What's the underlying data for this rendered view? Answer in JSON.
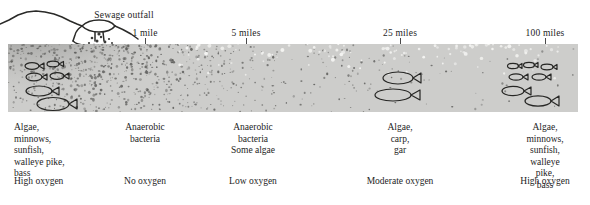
{
  "figure": {
    "title_annotation": "Sewage outfall",
    "water_color": "#cdcdcb",
    "ink_color": "#1d1d1d"
  },
  "axis": {
    "unit": "miles",
    "ticks": [
      {
        "label": "1 mile",
        "x": 145
      },
      {
        "label": "5 miles",
        "x": 246
      },
      {
        "label": "25 miles",
        "x": 400
      },
      {
        "label": "100 miles",
        "x": 545
      }
    ]
  },
  "zones": [
    {
      "id": "zone-clean-upstream",
      "x": 14,
      "align": "left",
      "species": "Algae,\nminnows,\nsunfish,\nwalleye pike,\nbass",
      "oxygen": "High oxygen",
      "oxygen_x": 14,
      "fish_count": 6,
      "turbidity": "clear"
    },
    {
      "id": "zone-septic",
      "x": 145,
      "align": "center",
      "species": "Anaerobic\nbacteria",
      "oxygen": "No oxygen",
      "oxygen_x": 145,
      "fish_count": 0,
      "turbidity": "very-heavy"
    },
    {
      "id": "zone-recovery-early",
      "x": 253,
      "align": "center",
      "species": "Anaerobic\nbacteria\nSome algae",
      "oxygen": "Low oxygen",
      "oxygen_x": 253,
      "fish_count": 0,
      "turbidity": "heavy"
    },
    {
      "id": "zone-recovery-late",
      "x": 400,
      "align": "center",
      "species": "Algae,\ncarp,\ngar",
      "oxygen": "Moderate oxygen",
      "oxygen_x": 400,
      "fish_count": 2,
      "turbidity": "light"
    },
    {
      "id": "zone-clean-downstream",
      "x": 545,
      "align": "center",
      "species": "Algae,\nminnows,\nsunfish,\nwalleye pike,\nbass",
      "oxygen": "High oxygen",
      "oxygen_x": 545,
      "fish_count": 7,
      "turbidity": "clear"
    }
  ],
  "chart_data": {
    "type": "diagram",
    "xlabel": "Distance downstream",
    "x_tick_labels": [
      "1 mile",
      "5 miles",
      "25 miles",
      "100 miles"
    ],
    "x_tick_pixels": [
      145,
      246,
      400,
      545
    ],
    "annotations": [
      "Sewage outfall"
    ],
    "categories": [
      "Upstream of outfall",
      "At outfall (1 mile)",
      "5 miles",
      "25 miles",
      "100 miles"
    ],
    "series": [
      {
        "name": "Oxygen level",
        "values": [
          "High oxygen",
          "No oxygen",
          "Low oxygen",
          "Moderate oxygen",
          "High oxygen"
        ]
      },
      {
        "name": "Dominant organisms",
        "values": [
          "Algae, minnows, sunfish, walleye pike, bass",
          "Anaerobic bacteria",
          "Anaerobic bacteria, Some algae",
          "Algae, carp, gar",
          "Algae, minnows, sunfish, walleye pike, bass"
        ]
      },
      {
        "name": "Fish depicted",
        "values": [
          6,
          0,
          0,
          2,
          7
        ]
      }
    ],
    "grid": false,
    "legend": "none"
  }
}
